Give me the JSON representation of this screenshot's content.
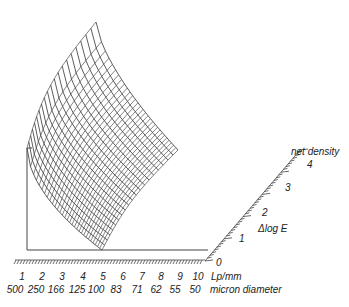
{
  "chart_data": {
    "type": "surface3d",
    "title": "",
    "x_axis": {
      "label_primary": "Lp/mm",
      "label_secondary": "micron diameter",
      "ticks_primary": [
        "1",
        "2",
        "3",
        "4",
        "5",
        "6",
        "7",
        "8",
        "9",
        "10"
      ],
      "ticks_secondary": [
        "500",
        "250",
        "166",
        "125",
        "100",
        "83",
        "71",
        "62",
        "55",
        "50"
      ]
    },
    "y_axis": {
      "label": "Δlog E",
      "ticks": [
        "0",
        "1",
        "2",
        "3",
        "4"
      ]
    },
    "z_axis": {
      "label": "net density",
      "ticks": [
        "4"
      ]
    }
  },
  "labels": {
    "lp_unit": "Lp/mm",
    "micron_unit": "micron diameter",
    "delta_log_e": "Δlog E",
    "net_density": "net density",
    "zero": "0",
    "z1": "1",
    "z2": "2",
    "z3": "3",
    "z4": "4"
  }
}
